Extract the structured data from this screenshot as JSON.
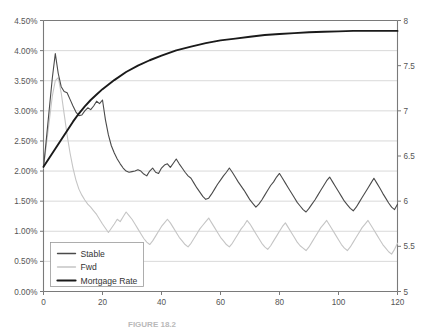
{
  "chart_data": {
    "type": "line",
    "title": "",
    "subtitle": "",
    "caption": "FIGURE 18.2",
    "xlabel": "",
    "ylabel": "",
    "y2label": "",
    "grid": true,
    "legend_position": "bottom-left",
    "xlim": [
      0,
      120
    ],
    "ylim": [
      0.0,
      4.5
    ],
    "y2lim": [
      5,
      8
    ],
    "xticks": [
      0,
      20,
      40,
      60,
      80,
      100,
      120
    ],
    "xtick_labels": [
      "0",
      "20",
      "40",
      "60",
      "80",
      "100",
      "120"
    ],
    "yticks": [
      0.0,
      0.5,
      1.0,
      1.5,
      2.0,
      2.5,
      3.0,
      3.5,
      4.0,
      4.5
    ],
    "ytick_labels": [
      "0.00%",
      "0.50%",
      "1.00%",
      "1.50%",
      "2.00%",
      "2.50%",
      "3.00%",
      "3.50%",
      "4.00%",
      "4.50%"
    ],
    "y2ticks": [
      5,
      5.5,
      6,
      6.5,
      7,
      7.5,
      8
    ],
    "y2tick_labels": [
      "5",
      "5.5",
      "6",
      "6.5",
      "7",
      "7.5",
      "8"
    ],
    "colors": {
      "stable": "#4a4a4a",
      "fwd": "#c5c5c5",
      "mortgage_rate": "#1a1a1a",
      "gridline": "#c9c9c9",
      "axis": "#7a7a7a",
      "background": "#ffffff"
    },
    "series": [
      {
        "name": "Stable",
        "axis": "left",
        "color": "#4a4a4a",
        "width": 1.1,
        "x": [
          0,
          1,
          2,
          3,
          4,
          5,
          6,
          7,
          8,
          9,
          10,
          11,
          12,
          13,
          14,
          15,
          16,
          17,
          18,
          19,
          20,
          21,
          22,
          23,
          24,
          25,
          26,
          27,
          28,
          29,
          30,
          31,
          32,
          33,
          34,
          35,
          36,
          37,
          38,
          39,
          40,
          41,
          42,
          43,
          44,
          45,
          46,
          47,
          48,
          49,
          50,
          51,
          52,
          53,
          54,
          55,
          56,
          57,
          58,
          59,
          60,
          61,
          62,
          63,
          64,
          65,
          66,
          67,
          68,
          69,
          70,
          71,
          72,
          73,
          74,
          75,
          76,
          77,
          78,
          79,
          80,
          81,
          82,
          83,
          84,
          85,
          86,
          87,
          88,
          89,
          90,
          91,
          92,
          93,
          94,
          95,
          96,
          97,
          98,
          99,
          100,
          101,
          102,
          103,
          104,
          105,
          106,
          107,
          108,
          109,
          110,
          111,
          112,
          113,
          114,
          115,
          116,
          117,
          118,
          119,
          120
        ],
        "values": [
          2.06,
          2.55,
          3.05,
          3.55,
          3.95,
          3.62,
          3.4,
          3.32,
          3.3,
          3.19,
          3.08,
          2.98,
          2.92,
          2.93,
          3.0,
          3.05,
          3.02,
          3.08,
          3.16,
          3.12,
          3.18,
          2.85,
          2.6,
          2.42,
          2.3,
          2.2,
          2.12,
          2.05,
          2.0,
          1.98,
          1.99,
          2.0,
          2.02,
          2.0,
          1.95,
          1.92,
          2.0,
          2.05,
          1.98,
          1.96,
          2.05,
          2.1,
          2.12,
          2.06,
          2.13,
          2.2,
          2.12,
          2.05,
          1.98,
          1.92,
          1.88,
          1.8,
          1.72,
          1.65,
          1.58,
          1.53,
          1.55,
          1.62,
          1.7,
          1.78,
          1.85,
          1.92,
          1.98,
          2.05,
          1.98,
          1.9,
          1.82,
          1.75,
          1.68,
          1.6,
          1.52,
          1.46,
          1.4,
          1.45,
          1.52,
          1.6,
          1.68,
          1.76,
          1.82,
          1.9,
          1.96,
          1.88,
          1.8,
          1.72,
          1.64,
          1.56,
          1.48,
          1.42,
          1.36,
          1.32,
          1.38,
          1.45,
          1.52,
          1.6,
          1.68,
          1.76,
          1.84,
          1.9,
          1.82,
          1.74,
          1.66,
          1.58,
          1.5,
          1.44,
          1.38,
          1.34,
          1.4,
          1.48,
          1.56,
          1.64,
          1.72,
          1.8,
          1.88,
          1.8,
          1.72,
          1.63,
          1.55,
          1.47,
          1.4,
          1.36,
          1.45
        ]
      },
      {
        "name": "Fwd",
        "axis": "left",
        "color": "#c5c5c5",
        "width": 1.1,
        "x": [
          0,
          1,
          2,
          3,
          4,
          5,
          6,
          7,
          8,
          9,
          10,
          11,
          12,
          13,
          14,
          15,
          16,
          17,
          18,
          19,
          20,
          21,
          22,
          23,
          24,
          25,
          26,
          27,
          28,
          29,
          30,
          31,
          32,
          33,
          34,
          35,
          36,
          37,
          38,
          39,
          40,
          41,
          42,
          43,
          44,
          45,
          46,
          47,
          48,
          49,
          50,
          51,
          52,
          53,
          54,
          55,
          56,
          57,
          58,
          59,
          60,
          61,
          62,
          63,
          64,
          65,
          66,
          67,
          68,
          69,
          70,
          71,
          72,
          73,
          74,
          75,
          76,
          77,
          78,
          79,
          80,
          81,
          82,
          83,
          84,
          85,
          86,
          87,
          88,
          89,
          90,
          91,
          92,
          93,
          94,
          95,
          96,
          97,
          98,
          99,
          100,
          101,
          102,
          103,
          104,
          105,
          106,
          107,
          108,
          109,
          110,
          111,
          112,
          113,
          114,
          115,
          116,
          117,
          118,
          119,
          120
        ],
        "values": [
          2.05,
          2.45,
          2.85,
          3.25,
          3.5,
          3.55,
          3.3,
          2.95,
          2.6,
          2.3,
          2.05,
          1.85,
          1.7,
          1.6,
          1.52,
          1.45,
          1.4,
          1.34,
          1.28,
          1.2,
          1.12,
          1.05,
          0.98,
          1.05,
          1.12,
          1.2,
          1.16,
          1.24,
          1.32,
          1.26,
          1.2,
          1.12,
          1.04,
          0.96,
          0.88,
          0.82,
          0.78,
          0.84,
          0.92,
          1.0,
          1.08,
          1.14,
          1.2,
          1.14,
          1.06,
          0.98,
          0.9,
          0.84,
          0.78,
          0.74,
          0.8,
          0.88,
          0.96,
          1.04,
          1.1,
          1.16,
          1.22,
          1.14,
          1.06,
          0.98,
          0.9,
          0.84,
          0.78,
          0.74,
          0.8,
          0.88,
          0.96,
          1.04,
          1.1,
          1.18,
          1.12,
          1.04,
          0.96,
          0.88,
          0.8,
          0.74,
          0.7,
          0.76,
          0.84,
          0.92,
          1.0,
          1.08,
          1.14,
          1.06,
          0.98,
          0.9,
          0.82,
          0.76,
          0.72,
          0.68,
          0.74,
          0.82,
          0.9,
          0.98,
          1.06,
          1.12,
          1.18,
          1.1,
          1.02,
          0.94,
          0.86,
          0.78,
          0.72,
          0.68,
          0.74,
          0.82,
          0.9,
          0.98,
          1.06,
          1.12,
          1.18,
          1.1,
          1.02,
          0.94,
          0.86,
          0.78,
          0.72,
          0.66,
          0.62,
          0.7,
          0.8
        ]
      },
      {
        "name": "Mortgage Rate",
        "axis": "right",
        "color": "#1a1a1a",
        "width": 1.9,
        "x": [
          0,
          2,
          4,
          6,
          8,
          10,
          12,
          14,
          16,
          18,
          20,
          24,
          28,
          32,
          36,
          40,
          45,
          50,
          55,
          60,
          65,
          70,
          75,
          80,
          85,
          90,
          95,
          100,
          105,
          110,
          115,
          120
        ],
        "values": [
          6.38,
          6.48,
          6.58,
          6.68,
          6.78,
          6.88,
          6.97,
          7.05,
          7.12,
          7.18,
          7.24,
          7.34,
          7.43,
          7.5,
          7.56,
          7.61,
          7.67,
          7.71,
          7.75,
          7.78,
          7.8,
          7.82,
          7.84,
          7.85,
          7.86,
          7.87,
          7.875,
          7.88,
          7.885,
          7.885,
          7.885,
          7.885
        ]
      }
    ],
    "legend": [
      {
        "label": "Stable",
        "color": "#4a4a4a",
        "width": 1.4
      },
      {
        "label": "Fwd",
        "color": "#c5c5c5",
        "width": 1.4
      },
      {
        "label": "Mortgage Rate",
        "color": "#1a1a1a",
        "width": 2.2
      }
    ]
  }
}
